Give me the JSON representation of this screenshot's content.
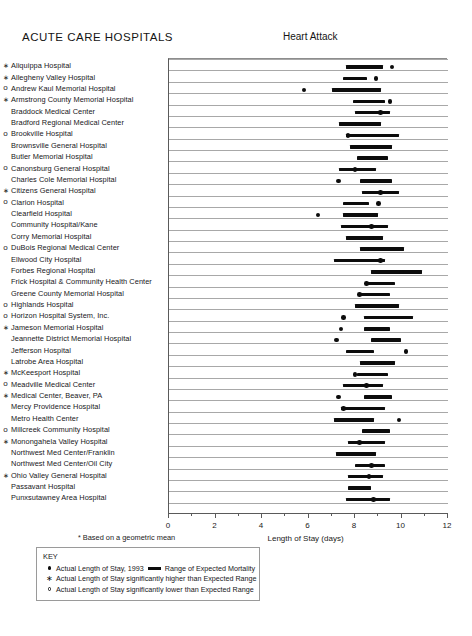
{
  "section_title": "ACUTE CARE HOSPITALS",
  "chart_title": "Heart Attack",
  "footnote": "Based on a geometric mean",
  "footnote_marker": "*",
  "key": {
    "title": "KEY",
    "rows": [
      {
        "marker": "filled-circle",
        "text_before": "Actual Length of Stay, 1993",
        "has_segment": true,
        "text_after": "Range of Expected Mortality"
      },
      {
        "marker": "star",
        "text_before": "Actual Length of Stay significantly higher than Expected Range",
        "has_segment": false,
        "text_after": ""
      },
      {
        "marker": "open-circle",
        "text_before": "Actual Length of Stay  significantly lower than Expected Range",
        "has_segment": false,
        "text_after": ""
      }
    ]
  },
  "chart_data": {
    "type": "bar",
    "title": "Heart Attack",
    "xlabel": "Length of Stay (days)",
    "ylabel": "",
    "xlim": [
      0,
      12
    ],
    "xticks_major": [
      0,
      2,
      4,
      6,
      8,
      10,
      12
    ],
    "xticks_minor": [
      1,
      3,
      5,
      7,
      9,
      11
    ],
    "grid": true,
    "legend_position": "below-left",
    "categories": [
      "Aliquippa Hospital",
      "Allegheny Valley Hospital",
      "Andrew Kaul Memorial Hospital",
      "Armstrong County Memorial Hospital",
      "Braddock Medical Center",
      "Bradford Regional Medical Center",
      "Brookville Hospital",
      "Brownsville General Hospital",
      "Butler Memorial Hospital",
      "Canonsburg General Hospital",
      "Charles Cole Memorial Hospital",
      "Citizens General Hospital",
      "Clarion Hospital",
      "Clearfield Hospital",
      "Community Hospital/Kane",
      "Corry Memorial Hospital",
      "DuBois Regional Medical Center",
      "Ellwood City Hospital",
      "Forbes Regional Hospital",
      "Frick Hospital & Community Health Center",
      "Greene County Memorial Hospital",
      "Highlands Hospital",
      "Horizon Hospital System, Inc.",
      "Jameson Memorial Hospital",
      "Jeannette District Memorial Hospital",
      "Jefferson Hospital",
      "Latrobe Area Hospital",
      "McKeesport Hospital",
      "Meadville Medical Center",
      "Medical Center, Beaver, PA",
      "Mercy Providence Hospital",
      "Metro Health Center",
      "Millcreek Community Hospital",
      "Monongahela Valley Hospital",
      "Northwest Med Center/Franklin",
      "Northwest Med Center/Oil City",
      "Ohio Valley General Hospital",
      "Passavant Hospital",
      "Punxsutawney Area Hospital"
    ],
    "series": [
      {
        "name": "Range of Expected Mortality",
        "type": "range-bar",
        "values": [
          [
            7.6,
            9.2
          ],
          [
            7.5,
            8.5
          ],
          [
            7.0,
            9.1
          ],
          [
            7.9,
            9.3
          ],
          [
            8.0,
            9.5
          ],
          [
            7.3,
            9.1
          ],
          [
            7.6,
            9.9
          ],
          [
            7.8,
            9.6
          ],
          [
            8.1,
            9.4
          ],
          [
            7.3,
            8.9
          ],
          [
            8.2,
            9.6
          ],
          [
            8.3,
            9.9
          ],
          [
            7.5,
            8.6
          ],
          [
            7.5,
            9.0
          ],
          [
            7.4,
            9.4
          ],
          [
            7.6,
            9.2
          ],
          [
            8.2,
            10.1
          ],
          [
            7.1,
            9.3
          ],
          [
            8.7,
            10.9
          ],
          [
            8.5,
            9.7
          ],
          [
            8.2,
            9.5
          ],
          [
            8.0,
            9.9
          ],
          [
            8.4,
            10.5
          ],
          [
            8.4,
            9.5
          ],
          [
            8.7,
            10.0
          ],
          [
            7.6,
            8.8
          ],
          [
            8.2,
            9.7
          ],
          [
            8.1,
            9.4
          ],
          [
            7.5,
            9.2
          ],
          [
            8.4,
            9.6
          ],
          [
            7.4,
            9.3
          ],
          [
            7.1,
            8.8
          ],
          [
            8.3,
            9.5
          ],
          [
            7.7,
            9.3
          ],
          [
            7.2,
            8.9
          ],
          [
            8.0,
            9.3
          ],
          [
            7.7,
            9.2
          ],
          [
            7.7,
            8.7
          ],
          [
            7.6,
            9.5
          ]
        ]
      },
      {
        "name": "Actual Length of Stay, 1993",
        "type": "point",
        "values": [
          9.6,
          8.9,
          5.8,
          9.5,
          9.1,
          8.1,
          7.7,
          8.9,
          8.6,
          8.0,
          7.3,
          9.1,
          9.0,
          6.4,
          8.7,
          8.7,
          8.5,
          9.1,
          10.0,
          8.5,
          8.2,
          8.3,
          7.5,
          7.4,
          7.2,
          10.2,
          9.2,
          8.0,
          8.5,
          7.3,
          7.5,
          9.9,
          9.0,
          8.2,
          7.7,
          8.7,
          8.6,
          8.6,
          8.8
        ]
      }
    ],
    "significance": [
      "higher",
      "higher",
      "lower",
      "higher",
      "none",
      "none",
      "lower",
      "none",
      "none",
      "lower",
      "none",
      "higher",
      "lower",
      "none",
      "none",
      "none",
      "lower",
      "none",
      "none",
      "none",
      "none",
      "lower",
      "lower",
      "higher",
      "none",
      "none",
      "none",
      "higher",
      "lower",
      "higher",
      "none",
      "none",
      "lower",
      "higher",
      "none",
      "none",
      "higher",
      "none",
      "none"
    ]
  }
}
